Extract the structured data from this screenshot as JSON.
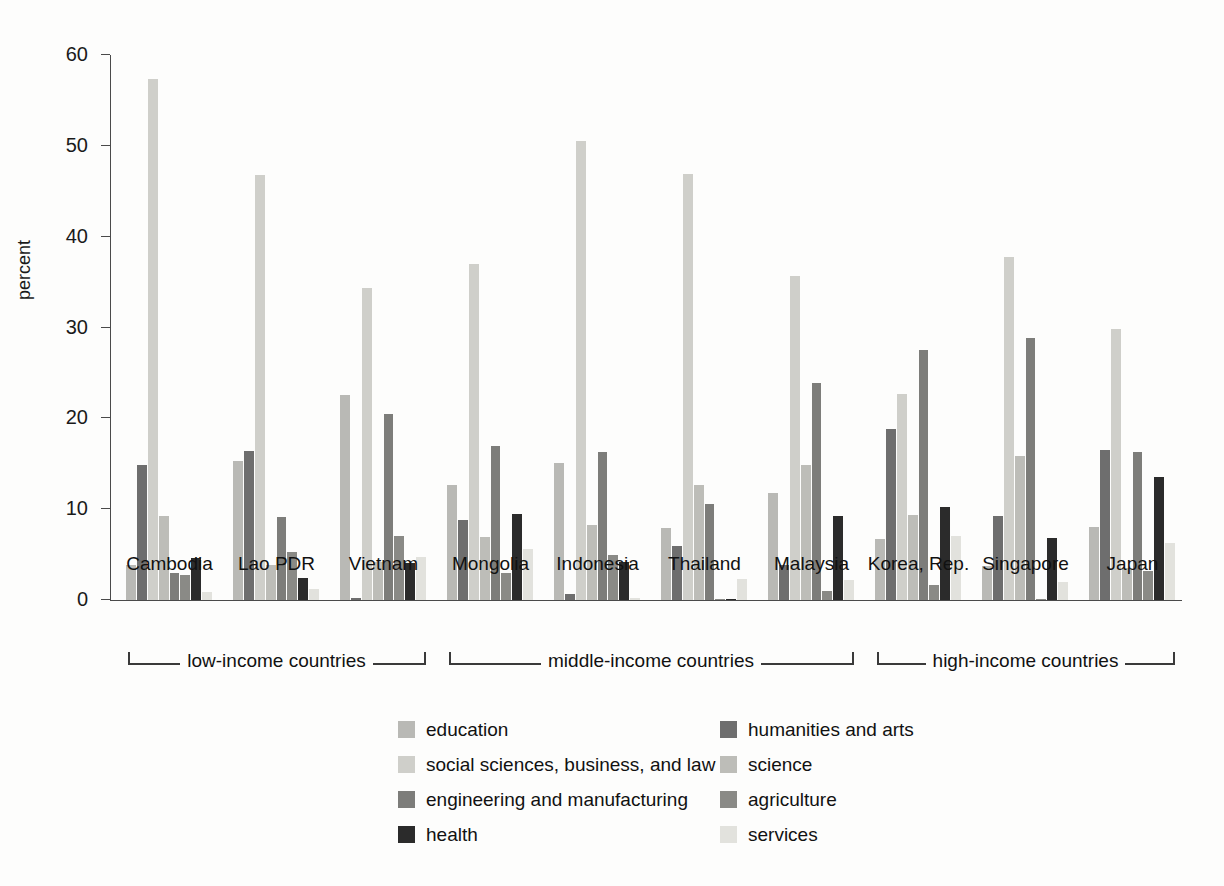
{
  "chart_data": {
    "type": "bar",
    "title": "",
    "subtitle": "",
    "xlabel": "",
    "ylabel": "percent",
    "ylim": [
      0,
      60
    ],
    "yticks": [
      0,
      10,
      20,
      30,
      40,
      50,
      60
    ],
    "grid": false,
    "legend_position": "bottom",
    "categories": [
      "Cambodia",
      "Lao PDR",
      "Vietnam",
      "Mongolia",
      "Indonesia",
      "Thailand",
      "Malaysia",
      "Korea, Rep.",
      "Singapore",
      "Japan"
    ],
    "series": [
      {
        "name": "education",
        "color": "#b9b9b5",
        "values": [
          3.9,
          15.3,
          22.6,
          12.7,
          15.1,
          7.9,
          11.8,
          6.7,
          3.7,
          8.0
        ]
      },
      {
        "name": "humanities and arts",
        "color": "#6e6e6e",
        "values": [
          14.9,
          16.4,
          0.2,
          8.8,
          0.7,
          5.9,
          3.8,
          18.8,
          9.2,
          16.5
        ]
      },
      {
        "name": "social sciences, business, and law",
        "color": "#cfcfca",
        "values": [
          57.4,
          46.8,
          34.4,
          37.0,
          50.5,
          46.9,
          35.7,
          22.7,
          37.8,
          29.8
        ]
      },
      {
        "name": "science",
        "color": "#bdbdb8",
        "values": [
          9.2,
          3.8,
          4.2,
          6.9,
          8.3,
          12.7,
          14.9,
          9.4,
          15.8,
          3.5
        ]
      },
      {
        "name": "engineering and manufacturing",
        "color": "#7d7d7a",
        "values": [
          3.0,
          9.1,
          20.5,
          17.0,
          16.3,
          10.6,
          23.9,
          27.5,
          28.8,
          16.3
        ]
      },
      {
        "name": "agriculture",
        "color": "#8a8a86",
        "values": [
          2.8,
          5.3,
          7.1,
          3.0,
          5.0,
          0.1,
          1.0,
          1.7,
          0.1,
          3.2
        ]
      },
      {
        "name": "health",
        "color": "#2b2b2b",
        "values": [
          4.6,
          2.4,
          4.1,
          9.5,
          4.2,
          0.1,
          9.3,
          10.2,
          6.8,
          13.5
        ]
      },
      {
        "name": "services",
        "color": "#e2e2dd",
        "values": [
          0.9,
          1.2,
          4.7,
          5.6,
          0.2,
          2.3,
          2.2,
          7.0,
          2.0,
          6.3
        ]
      }
    ],
    "group_brackets": [
      {
        "label": "low-income countries",
        "from": "Cambodia",
        "to": "Vietnam"
      },
      {
        "label": "middle-income countries",
        "from": "Mongolia",
        "to": "Malaysia"
      },
      {
        "label": "high-income countries",
        "from": "Korea, Rep.",
        "to": "Japan"
      }
    ]
  },
  "axis": {
    "y_label": "percent",
    "y_tick_labels": [
      "0",
      "10",
      "20",
      "30",
      "40",
      "50",
      "60"
    ]
  },
  "legend": {
    "left_column": [
      {
        "label": "education",
        "color": "#b9b9b5"
      },
      {
        "label": "social sciences, business, and law",
        "color": "#cfcfca"
      },
      {
        "label": "engineering and manufacturing",
        "color": "#7d7d7a"
      },
      {
        "label": "health",
        "color": "#2b2b2b"
      }
    ],
    "right_column": [
      {
        "label": "humanities and arts",
        "color": "#6e6e6e"
      },
      {
        "label": "science",
        "color": "#bdbdb8"
      },
      {
        "label": "agriculture",
        "color": "#8a8a86"
      },
      {
        "label": "services",
        "color": "#e2e2dd"
      }
    ]
  },
  "brackets": [
    {
      "label": "low-income countries"
    },
    {
      "label": "middle-income countries"
    },
    {
      "label": "high-income countries"
    }
  ]
}
